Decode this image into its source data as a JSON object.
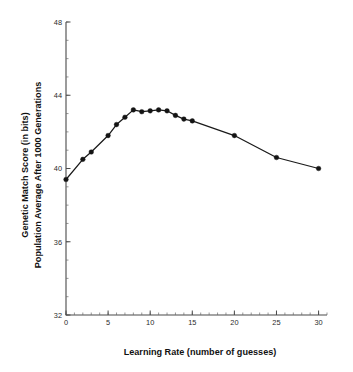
{
  "chart_data": {
    "type": "line",
    "title": "",
    "subtitle": "",
    "xlabel": "Learning Rate (number of guesses)",
    "ylabel_line1": "Genetic Match Score (in bits)",
    "ylabel_line2": "Population Average After 1000 Generations",
    "xlim": [
      0,
      31
    ],
    "ylim": [
      32,
      48
    ],
    "xticks": [
      0,
      5,
      10,
      15,
      20,
      25,
      30
    ],
    "xtick_labels": [
      "0",
      "5",
      "10",
      "15",
      "20",
      "25",
      "30"
    ],
    "yticks": [
      32,
      36,
      40,
      44,
      48
    ],
    "ytick_labels": [
      "32",
      "36",
      "40",
      "44",
      "48"
    ],
    "x_minor_tick_step": 1,
    "y_minor_tick_step": 1,
    "grid": false,
    "legend": null,
    "marker": "filled-circle",
    "line_color": "#1a1a1a",
    "marker_color": "#141414",
    "axis_color": "#4a4a4a",
    "background_color": "#ffffff",
    "series": [
      {
        "name": "Population Average",
        "x": [
          0,
          2,
          3,
          5,
          6,
          7,
          8,
          9,
          10,
          11,
          12,
          13,
          14,
          15,
          20,
          25,
          30
        ],
        "values": [
          39.4,
          40.5,
          40.9,
          41.8,
          42.4,
          42.8,
          43.2,
          43.1,
          43.15,
          43.2,
          43.15,
          42.9,
          42.7,
          42.6,
          41.8,
          40.6,
          40.0
        ]
      }
    ]
  }
}
